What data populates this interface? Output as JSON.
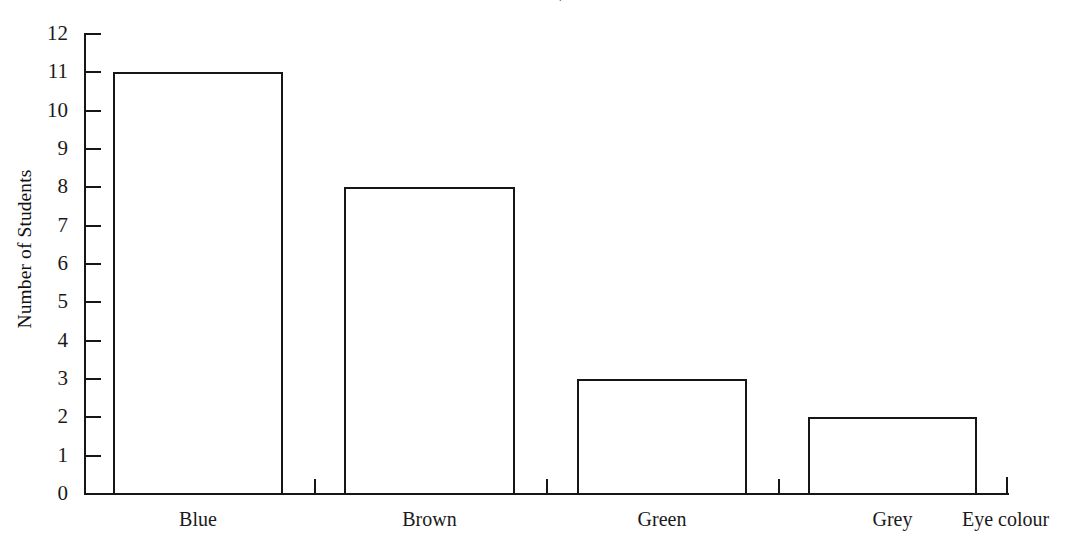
{
  "chart_data": {
    "type": "bar",
    "title": "",
    "title_remnant": "y",
    "categories": [
      "Blue",
      "Brown",
      "Green",
      "Grey"
    ],
    "values": [
      11,
      8,
      3,
      2
    ],
    "xlabel": "Eye colour",
    "ylabel": "Number of Students",
    "ylim": [
      0,
      12
    ],
    "ytick_labels": [
      "12",
      "11",
      "10",
      "9",
      "8",
      "7",
      "6",
      "5",
      "4",
      "3",
      "2",
      "1",
      "0"
    ],
    "ytick_values": [
      12,
      11,
      10,
      9,
      8,
      7,
      6,
      5,
      4,
      3,
      2,
      1,
      0
    ],
    "ytick_step": 1,
    "grid": false,
    "legend": false,
    "bar_fill_color": "#ffffff",
    "bar_outline_color": "#161616",
    "axis_color": "#161616",
    "background_color": "#ffffff"
  }
}
